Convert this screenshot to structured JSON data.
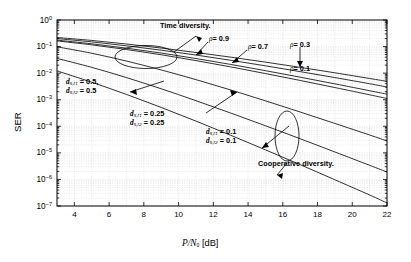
{
  "chart_data": {
    "type": "line",
    "title": "",
    "xlabel": "P/N0 [dB]",
    "ylabel": "SER",
    "xlim": [
      3,
      22
    ],
    "ylim": [
      1e-07,
      1
    ],
    "yscale": "log",
    "grid": true,
    "legend": "none",
    "xticks": [
      "4",
      "6",
      "8",
      "10",
      "12",
      "14",
      "16",
      "18",
      "20",
      "22"
    ],
    "xtick_values": [
      4,
      6,
      8,
      10,
      12,
      14,
      16,
      18,
      20,
      22
    ],
    "yticks": [
      "10^0",
      "10^-1",
      "10^-2",
      "10^-3",
      "10^-4",
      "10^-5",
      "10^-6",
      "10^-7"
    ],
    "ytick_exponents": [
      0,
      -1,
      -2,
      -3,
      -4,
      -5,
      -6,
      -7
    ],
    "series": [
      {
        "name": "rho = 0.9 (time diversity)",
        "group": "time-diversity",
        "rho": 0.9,
        "x": [
          3,
          5,
          7,
          9,
          11,
          13,
          15,
          17,
          19,
          21,
          22
        ],
        "y": [
          0.22,
          0.17,
          0.125,
          0.088,
          0.06,
          0.04,
          0.026,
          0.0165,
          0.0103,
          0.0063,
          0.0049
        ]
      },
      {
        "name": "rho = 0.7 (time diversity)",
        "group": "time-diversity",
        "rho": 0.7,
        "x": [
          3,
          5,
          7,
          9,
          11,
          13,
          15,
          17,
          19,
          21,
          22
        ],
        "y": [
          0.2,
          0.15,
          0.107,
          0.073,
          0.048,
          0.0305,
          0.0189,
          0.0114,
          0.0068,
          0.004,
          0.003
        ]
      },
      {
        "name": "rho = 0.3 (time diversity)",
        "group": "time-diversity",
        "rho": 0.3,
        "x": [
          3,
          5,
          7,
          9,
          11,
          13,
          15,
          17,
          19,
          21,
          22
        ],
        "y": [
          0.175,
          0.127,
          0.087,
          0.057,
          0.0355,
          0.0213,
          0.0124,
          0.00705,
          0.00395,
          0.00218,
          0.00162
        ]
      },
      {
        "name": "rho = 0.1 (time diversity)",
        "group": "time-diversity",
        "rho": 0.1,
        "x": [
          3,
          5,
          7,
          9,
          11,
          13,
          15,
          17,
          19,
          21,
          22
        ],
        "y": [
          0.163,
          0.116,
          0.0775,
          0.0492,
          0.0297,
          0.0172,
          0.00965,
          0.00531,
          0.00287,
          0.00153,
          0.00111
        ]
      },
      {
        "name": "cooperative d=0.5",
        "group": "cooperative",
        "d_sr1": 0.5,
        "d_sr2": 0.5,
        "x": [
          3,
          5,
          7,
          9,
          11,
          13,
          15,
          17,
          19,
          21,
          22
        ],
        "y": [
          0.098,
          0.056,
          0.0285,
          0.0132,
          0.0057,
          0.00233,
          0.00091,
          0.000345,
          0.000128,
          4.7e-05,
          2.8e-05
        ]
      },
      {
        "name": "cooperative d=0.25",
        "group": "cooperative",
        "d_sr1": 0.25,
        "d_sr2": 0.25,
        "x": [
          3,
          5,
          7,
          9,
          11,
          13,
          15,
          17,
          19,
          21,
          22
        ],
        "y": [
          0.036,
          0.0165,
          0.0068,
          0.00258,
          0.00092,
          0.000315,
          0.000105,
          3.4e-05,
          1.08e-05,
          3.4e-06,
          1.9e-06
        ]
      },
      {
        "name": "cooperative d=0.1",
        "group": "cooperative",
        "d_sr1": 0.1,
        "d_sr2": 0.1,
        "x": [
          3,
          5,
          7,
          9,
          11,
          13,
          15,
          17,
          19,
          21,
          22
        ],
        "y": [
          0.0122,
          0.00455,
          0.00158,
          0.00051,
          0.000157,
          4.6e-05,
          1.3e-05,
          3.6e-06,
          9.7e-07,
          2.6e-07,
          1.3e-07
        ]
      }
    ],
    "annotations": [
      {
        "id": "time-diversity",
        "text": "Time diversity."
      },
      {
        "id": "cooperative-diversity",
        "text": "Cooperative diversity."
      },
      {
        "id": "rho-09",
        "text": "= 0.9",
        "symbol": "ρ"
      },
      {
        "id": "rho-07",
        "text": "= 0.7",
        "symbol": "ρ"
      },
      {
        "id": "rho-03",
        "text": "= 0.3",
        "symbol": "ρ"
      },
      {
        "id": "rho-01",
        "text": "= 0.1",
        "symbol": "ρ"
      },
      {
        "id": "d-05",
        "line1": "= 0.5,",
        "line2": "= 0.5"
      },
      {
        "id": "d-025",
        "line1": "= 0.25",
        "line2": "= 0.25"
      },
      {
        "id": "d-01",
        "line1": "= 0.1",
        "line2": "= 0.1"
      }
    ]
  },
  "axes": {
    "ylabel": "SER",
    "xlabel_num": "P/N",
    "xlabel_sub": "0",
    "xlabel_unit": " [dB]"
  },
  "labels": {
    "time_diversity": "Time diversity.",
    "cooperative_diversity": "Cooperative diversity.",
    "rho_09": "= 0.9",
    "rho_07": "= 0.7",
    "rho_03": "= 0.3",
    "rho_01": "= 0.1",
    "rho_sym": "ρ",
    "d_sym": "d",
    "d05_l1": "= 0.5,",
    "d05_l2": "= 0.5",
    "d025_l1": "= 0.25",
    "d025_l2": "= 0.25",
    "d01_l1": "= 0.1",
    "d01_l2": "= 0.1",
    "sub_sr1": "s,r",
    "sub_sr2": "s,r",
    "sub_1": "1",
    "sub_2": "2"
  }
}
